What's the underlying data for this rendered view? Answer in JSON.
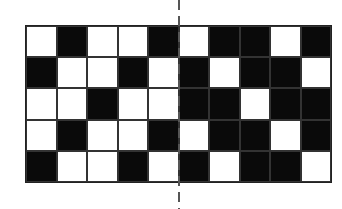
{
  "diagram": {
    "type": "binary-grid-pattern",
    "rows": 5,
    "columns": 10,
    "colors": {
      "filled": "#0a0a0a",
      "empty": "#ffffff",
      "axis": "#555555"
    },
    "cells": [
      [
        0,
        1,
        0,
        0,
        1,
        0,
        1,
        1,
        0,
        1
      ],
      [
        1,
        0,
        0,
        1,
        0,
        1,
        0,
        1,
        1,
        0
      ],
      [
        0,
        0,
        1,
        0,
        0,
        1,
        1,
        0,
        1,
        1
      ],
      [
        0,
        1,
        0,
        0,
        1,
        0,
        1,
        1,
        0,
        1
      ],
      [
        1,
        0,
        0,
        1,
        0,
        1,
        0,
        1,
        1,
        0
      ]
    ],
    "symmetry_axis": {
      "orientation": "vertical",
      "style": "dashed",
      "between_columns": [
        5,
        6
      ]
    }
  }
}
